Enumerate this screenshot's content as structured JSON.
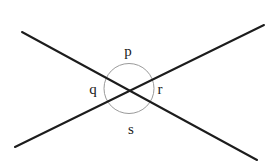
{
  "figure": {
    "kind": "geometry-diagram",
    "background_color": "#ffffff",
    "width": 269,
    "height": 166,
    "line_color": "#1c1c1c",
    "circle_color": "#9a9a9a",
    "label_color": "#1a1a1a"
  },
  "circle": {
    "name": "angle-circle",
    "cx": 129,
    "cy": 88.5,
    "r": 25,
    "stroke_width": 1
  },
  "lines": [
    {
      "name": "line-falling",
      "x1": 22,
      "y1": 32,
      "x2": 257,
      "y2": 160,
      "stroke_width": 2
    },
    {
      "name": "line-rising",
      "x1": 15,
      "y1": 147,
      "x2": 264,
      "y2": 25,
      "stroke_width": 2
    }
  ],
  "intersection": {
    "x": 130,
    "y": 90
  },
  "labels": [
    {
      "id": "p",
      "text": "p",
      "x": 128,
      "y": 51,
      "position": "top"
    },
    {
      "id": "q",
      "text": "q",
      "x": 93,
      "y": 89,
      "position": "left"
    },
    {
      "id": "r",
      "text": "r",
      "x": 160,
      "y": 89,
      "position": "right"
    },
    {
      "id": "s",
      "text": "s",
      "x": 131,
      "y": 129,
      "position": "bottom"
    }
  ]
}
